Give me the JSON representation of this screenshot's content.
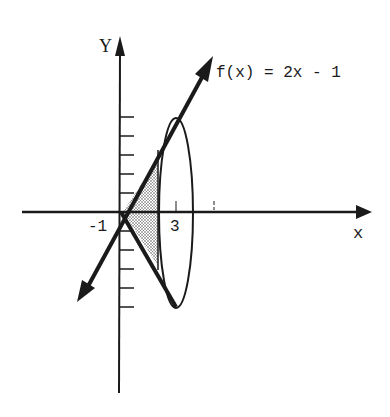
{
  "diagram": {
    "type": "solid-of-revolution-sketch",
    "function_label": "f(x) = 2x - 1",
    "axes": {
      "x_label": "x",
      "y_label": "Y",
      "tick_labels": {
        "neg_one": "-1",
        "three": "3"
      }
    },
    "colors": {
      "ink": "#1a1a1a",
      "background": "#ffffff",
      "shade": "#8a8a8a"
    },
    "elements": [
      "x-axis with arrow",
      "y-axis with arrow and tick marks",
      "line f(x) = 2x - 1 with arrows",
      "reflected line below x-axis",
      "ellipse at x = 3 representing cross-section of revolution",
      "shaded triangular region between the lines up to x = 3"
    ]
  }
}
